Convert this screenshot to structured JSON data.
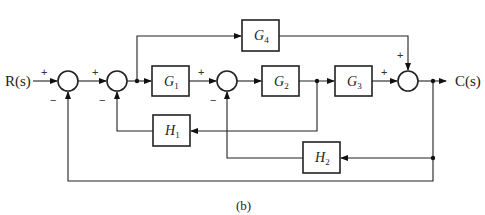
{
  "diagram": {
    "type": "block-diagram",
    "input": {
      "label": "R(s)"
    },
    "output": {
      "label": "C(s)"
    },
    "caption": "(b)",
    "blocks": [
      {
        "id": "G1",
        "name": "G",
        "sub": "1"
      },
      {
        "id": "G2",
        "name": "G",
        "sub": "2"
      },
      {
        "id": "G3",
        "name": "G",
        "sub": "3"
      },
      {
        "id": "G4",
        "name": "G",
        "sub": "4"
      },
      {
        "id": "H1",
        "name": "H",
        "sub": "1"
      },
      {
        "id": "H2",
        "name": "H",
        "sub": "2"
      }
    ],
    "summing_junctions": [
      {
        "id": "S1",
        "signs": {
          "left": "+",
          "bottom": "−"
        }
      },
      {
        "id": "S2",
        "signs": {
          "left": "+",
          "bottom": "−"
        }
      },
      {
        "id": "S3",
        "signs": {
          "left": "+",
          "bottom": "−"
        }
      },
      {
        "id": "S4",
        "signs": {
          "left": "+",
          "top": "+"
        }
      }
    ],
    "connections": [
      "R(s) -> S1 (+)",
      "S1 -> S2 (+)",
      "S2 -> G1",
      "S2 output -> G4 (feedforward)",
      "G1 -> S3 (+)",
      "S3 -> G2",
      "G2 -> G3",
      "G2 output -> H1 -> S2 (−)",
      "G3 -> S4 (+)",
      "G4 -> S4 (+)",
      "S4 -> C(s)",
      "C(s) -> H2 -> S3 (−)",
      "C(s) -> S1 (−) (unity feedback)"
    ]
  }
}
